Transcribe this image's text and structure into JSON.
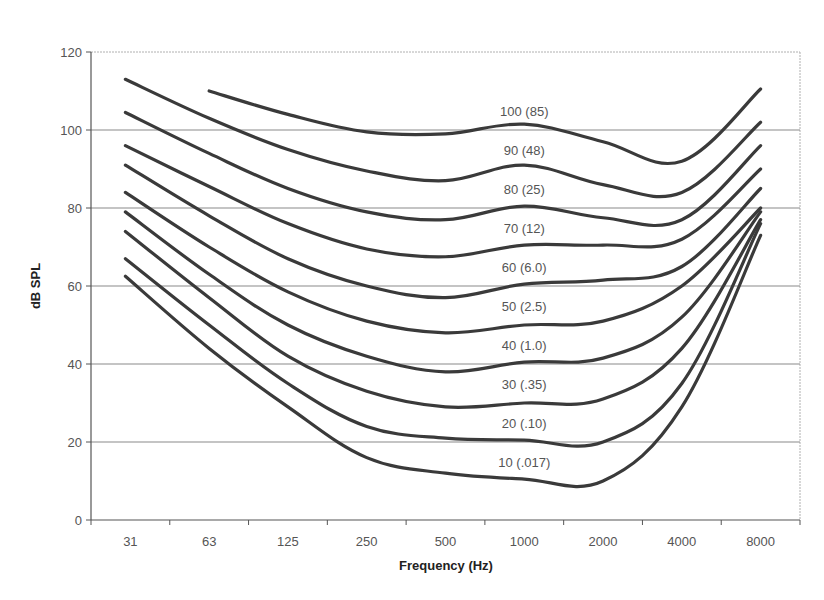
{
  "chart_data": {
    "type": "line",
    "title": "",
    "xlabel": "Frequency (Hz)",
    "ylabel": "dB SPL",
    "categories": [
      "31",
      "63",
      "125",
      "250",
      "500",
      "1000",
      "2000",
      "4000",
      "8000"
    ],
    "ylim": [
      0,
      120
    ],
    "yticks": [
      0,
      20,
      40,
      60,
      80,
      100,
      120
    ],
    "grid": {
      "horizontal": true,
      "vertical": false
    },
    "legend": "none (inline curve labels)",
    "series": [
      {
        "name": "100 (85)",
        "values": [
          null,
          110,
          104,
          99.5,
          99,
          101.5,
          97,
          92,
          110.5
        ]
      },
      {
        "name": "90 (48)",
        "values": [
          113,
          103,
          95,
          89.5,
          87,
          91,
          86,
          84,
          102
        ]
      },
      {
        "name": "80 (25)",
        "values": [
          104.5,
          94,
          85,
          79,
          77,
          80.5,
          77.5,
          77,
          96
        ]
      },
      {
        "name": "70 (12)",
        "values": [
          96,
          85.5,
          76,
          69.5,
          67.5,
          70.5,
          70.5,
          72,
          90
        ]
      },
      {
        "name": "60 (6.0)",
        "values": [
          91,
          78,
          67,
          60,
          57,
          60.5,
          61.5,
          65,
          85
        ]
      },
      {
        "name": "50 (2.5)",
        "values": [
          84,
          70,
          58.5,
          51,
          48,
          50,
          51,
          60,
          80
        ]
      },
      {
        "name": "40 (1.0)",
        "values": [
          79,
          63,
          50,
          42,
          38,
          40.5,
          41.5,
          52,
          79
        ]
      },
      {
        "name": "30 (.35)",
        "values": [
          74,
          57,
          42,
          33,
          29,
          30,
          31,
          44,
          77
        ]
      },
      {
        "name": "20 (.10)",
        "values": [
          67,
          50,
          35,
          24,
          21,
          20.5,
          20,
          35,
          76
        ]
      },
      {
        "name": "10 (.017)",
        "values": [
          62.5,
          44,
          29,
          16,
          12,
          10.5,
          10,
          29,
          73
        ]
      }
    ],
    "annotations": [
      {
        "text": "100 (85)",
        "x": "1000",
        "y": 105
      },
      {
        "text": "90 (48)",
        "x": "1000",
        "y": 95
      },
      {
        "text": "80 (25)",
        "x": "1000",
        "y": 85
      },
      {
        "text": "70 (12)",
        "x": "1000",
        "y": 75
      },
      {
        "text": "60 (6.0)",
        "x": "1000",
        "y": 65
      },
      {
        "text": "50 (2.5)",
        "x": "1000",
        "y": 55
      },
      {
        "text": "40 (1.0)",
        "x": "1000",
        "y": 45
      },
      {
        "text": "30 (.35)",
        "x": "1000",
        "y": 35
      },
      {
        "text": "20 (.10)",
        "x": "1000",
        "y": 25
      },
      {
        "text": "10 (.017)",
        "x": "1000",
        "y": 15
      }
    ]
  },
  "style": {
    "line_color": "#3a3a3a",
    "grid_color": "#8a8a8a",
    "axis_color": "#555555",
    "border_color": "#b0b0b0"
  }
}
